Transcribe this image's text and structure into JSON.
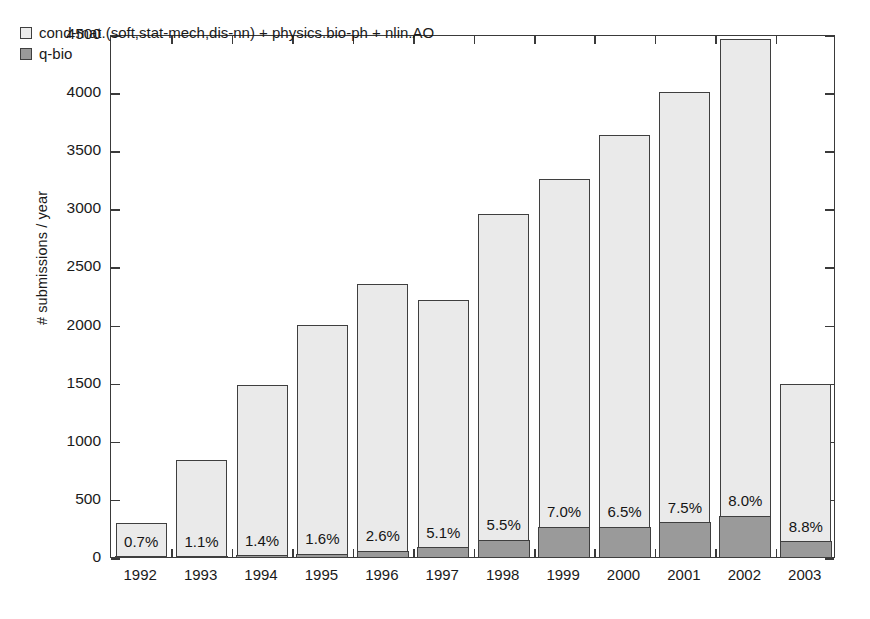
{
  "chart_data": {
    "type": "bar",
    "title": "",
    "subtitle": "",
    "xlabel": "",
    "ylabel": "# submissions / year",
    "stacked": true,
    "grid": false,
    "legend_position": "top-left",
    "ylim": [
      0,
      4500
    ],
    "yticks": [
      0,
      500,
      1000,
      1500,
      2000,
      2500,
      3000,
      3500,
      4000,
      4500
    ],
    "ytick_labels": [
      "0",
      "500",
      "1000",
      "1500",
      "2000",
      "2500",
      "3000",
      "3500",
      "4000",
      "4500"
    ],
    "categories": [
      "1992",
      "1993",
      "1994",
      "1995",
      "1996",
      "1997",
      "1998",
      "1999",
      "2000",
      "2001",
      "2002",
      "2003"
    ],
    "series": [
      {
        "name": "cond-mat.(soft,stat-mech,dis-nn) + physics.bio-ph + nlin.AO",
        "color": "#eaeaea",
        "values": [
          288,
          822,
          1475,
          1992,
          2292,
          2120,
          2795,
          2985,
          3365,
          3700,
          4100,
          1350
        ]
      },
      {
        "name": "q-bio",
        "color": "#9a9a9a",
        "values": [
          2,
          9,
          21,
          32,
          60,
          90,
          155,
          265,
          265,
          305,
          360,
          140
        ]
      }
    ],
    "totals": [
      290,
      831,
      1478,
      2000,
      2352,
      2210,
      2950,
      3250,
      3630,
      4005,
      4460,
      1490
    ],
    "annotations": {
      "label": "q-bio share of total",
      "values": [
        "0.7%",
        "1.1%",
        "1.4%",
        "1.6%",
        "2.6%",
        "5.1%",
        "5.5%",
        "7.0%",
        "6.5%",
        "7.5%",
        "8.0%",
        "8.8%"
      ]
    }
  },
  "legend": {
    "items": [
      {
        "swatch": "light-gray-square",
        "label": "cond-mat.(soft,stat-mech,dis-nn) + physics.bio-ph + nlin.AO"
      },
      {
        "swatch": "dark-gray-square",
        "label": "q-bio"
      }
    ]
  },
  "axes": {
    "y_title": "# submissions / year"
  },
  "colors": {
    "series_light": "#eaeaea",
    "series_dark": "#9a9a9a",
    "axis": "#3a3a3a",
    "text": "#1a1a1a"
  }
}
